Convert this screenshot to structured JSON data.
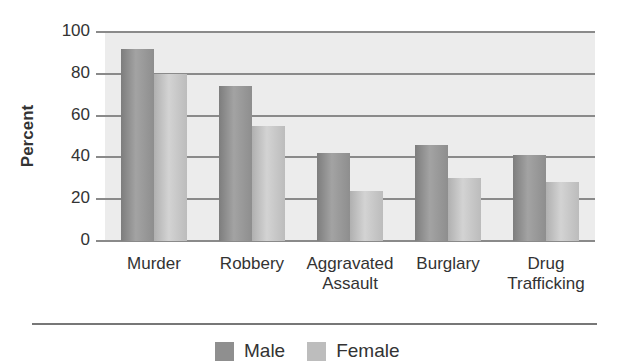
{
  "chart_data": {
    "type": "bar",
    "title": "",
    "xlabel": "",
    "ylabel": "Percent",
    "ylim": [
      0,
      100
    ],
    "yticks": [
      0,
      20,
      40,
      60,
      80,
      100
    ],
    "grid": true,
    "legend_position": "bottom",
    "categories": [
      "Murder",
      "Robbery",
      "Aggravated Assault",
      "Burglary",
      "Drug Trafficking"
    ],
    "category_lines": [
      [
        "Murder"
      ],
      [
        "Robbery"
      ],
      [
        "Aggravated",
        "Assault"
      ],
      [
        "Burglary"
      ],
      [
        "Drug",
        "Trafficking"
      ]
    ],
    "series": [
      {
        "name": "Male",
        "color": "#8f8f8f",
        "values": [
          92,
          74,
          42,
          46,
          41
        ]
      },
      {
        "name": "Female",
        "color": "#bdbdbd",
        "values": [
          80,
          55,
          24,
          30,
          28
        ]
      }
    ]
  },
  "legend": {
    "male": "Male",
    "female": "Female"
  }
}
